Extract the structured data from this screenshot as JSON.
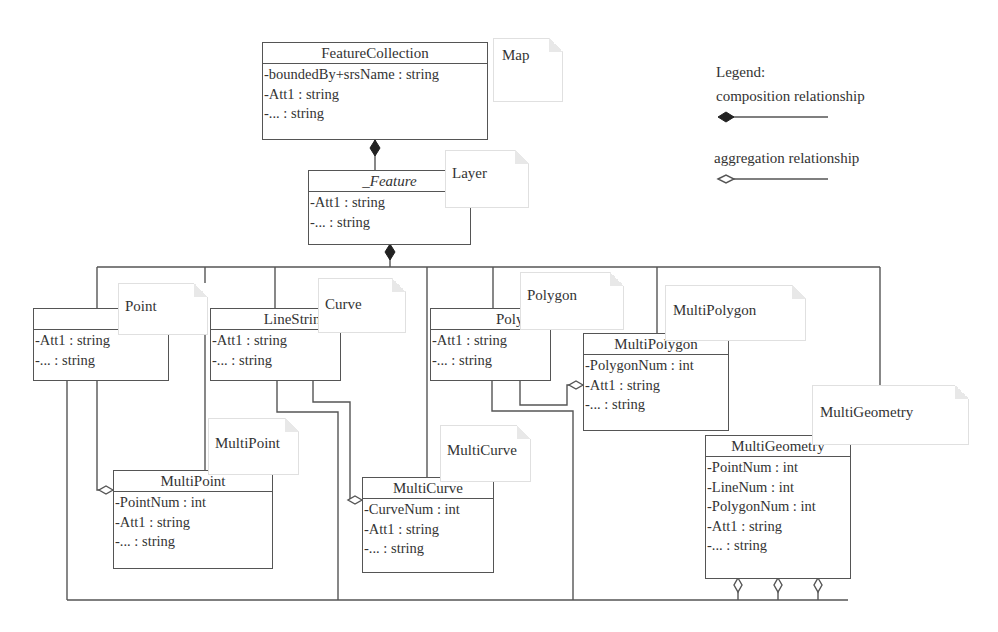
{
  "legend": {
    "title": "Legend:",
    "composition": "composition relationship",
    "aggregation": "aggregation relationship"
  },
  "classes": {
    "feature_collection": {
      "name": "FeatureCollection",
      "attributes": [
        "-boundedBy+srsName : string",
        "-Att1 : string",
        "-... : string"
      ]
    },
    "feature": {
      "name": "_Feature",
      "attributes": [
        "-Att1 : string",
        "-... : string"
      ]
    },
    "point": {
      "name": "Point",
      "attributes": [
        "-Att1 : string",
        "-... : string"
      ]
    },
    "linestring": {
      "name": "LineString",
      "attributes": [
        "-Att1 : string",
        "-... : string"
      ]
    },
    "polygon": {
      "name": "Polygon",
      "attributes": [
        "-Att1 : string",
        "-... : string"
      ]
    },
    "multipolygon": {
      "name": "MultiPolygon",
      "attributes": [
        "-PolygonNum : int",
        "-Att1 : string",
        "-... : string"
      ]
    },
    "multipoint": {
      "name": "MultiPoint",
      "attributes": [
        "-PointNum : int",
        "-Att1 : string",
        "-... : string"
      ]
    },
    "multicurve": {
      "name": "MultiCurve",
      "attributes": [
        "-CurveNum : int",
        "-Att1 : string",
        "-... : string"
      ]
    },
    "multigeometry": {
      "name": "MultiGeometry",
      "attributes": [
        "-PointNum : int",
        "-LineNum : int",
        "-PolygonNum : int",
        "-Att1 : string",
        "-... : string"
      ]
    }
  },
  "notes": {
    "map": "Map",
    "layer": "Layer",
    "point": "Point",
    "curve": "Curve",
    "polygon": "Polygon",
    "multipolygon": "MultiPolygon",
    "multipoint": "MultiPoint",
    "multicurve": "MultiCurve",
    "multigeometry": "MultiGeometry"
  },
  "relationships": [
    {
      "type": "composition",
      "from": "FeatureCollection",
      "to": "_Feature"
    },
    {
      "type": "composition",
      "from": "_Feature",
      "to": "Point"
    },
    {
      "type": "composition",
      "from": "_Feature",
      "to": "LineString"
    },
    {
      "type": "composition",
      "from": "_Feature",
      "to": "Polygon"
    },
    {
      "type": "composition",
      "from": "_Feature",
      "to": "MultiPoint"
    },
    {
      "type": "composition",
      "from": "_Feature",
      "to": "MultiCurve"
    },
    {
      "type": "composition",
      "from": "_Feature",
      "to": "MultiPolygon"
    },
    {
      "type": "composition",
      "from": "_Feature",
      "to": "MultiGeometry"
    },
    {
      "type": "aggregation",
      "from": "MultiPoint",
      "to": "Point"
    },
    {
      "type": "aggregation",
      "from": "MultiCurve",
      "to": "LineString"
    },
    {
      "type": "aggregation",
      "from": "MultiPolygon",
      "to": "Polygon"
    },
    {
      "type": "aggregation",
      "from": "MultiGeometry",
      "to": "Point"
    },
    {
      "type": "aggregation",
      "from": "MultiGeometry",
      "to": "LineString"
    },
    {
      "type": "aggregation",
      "from": "MultiGeometry",
      "to": "Polygon"
    }
  ]
}
